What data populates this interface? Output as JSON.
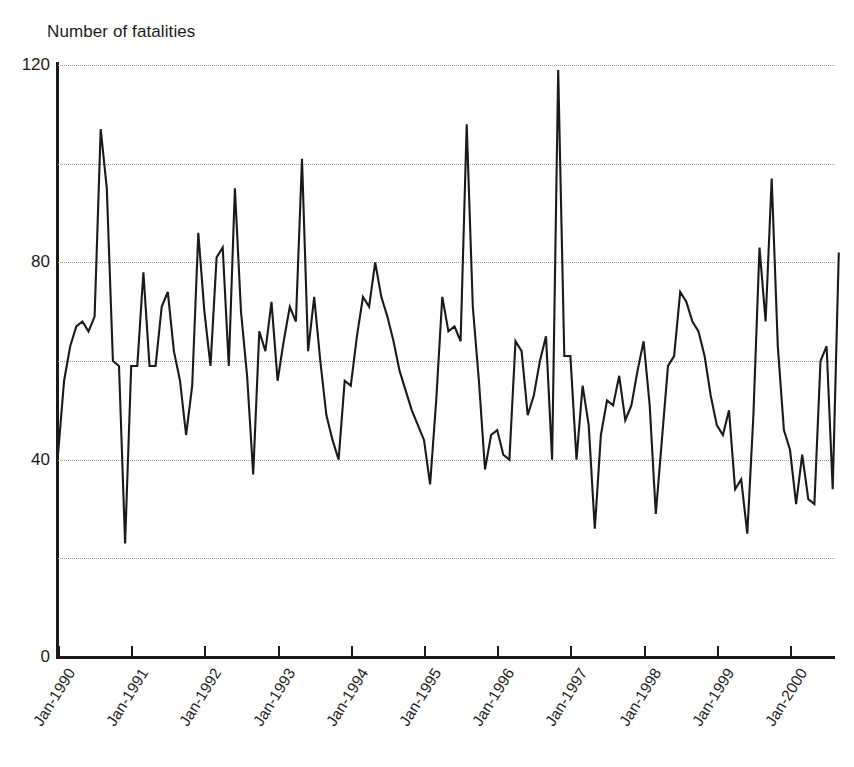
{
  "chart_data": {
    "type": "line",
    "title": "",
    "ylabel": "Number of fatalities",
    "xlabel": "",
    "ylim": [
      0,
      120
    ],
    "yticks": [
      0,
      40,
      80,
      120
    ],
    "gridlines": [
      20,
      40,
      60,
      80,
      100,
      120
    ],
    "grid": true,
    "legend": "none",
    "x_tick_labels": [
      "Jan-1990",
      "Jan-1991",
      "Jan-1992",
      "Jan-1993",
      "Jan-1994",
      "Jan-1995",
      "Jan-1996",
      "Jan-1997",
      "Jan-1998",
      "Jan-1999",
      "Jan-2000"
    ],
    "x_start": "Jan-1990",
    "x_end": "Sep-2000",
    "x_interval": "monthly",
    "series": [
      {
        "name": "Number of fatalities",
        "color": "#1a1a1a",
        "values": [
          41,
          56,
          63,
          67,
          68,
          66,
          69,
          107,
          95,
          60,
          59,
          23,
          59,
          59,
          78,
          59,
          59,
          71,
          74,
          62,
          56,
          45,
          55,
          86,
          70,
          59,
          81,
          83,
          59,
          95,
          70,
          57,
          37,
          66,
          62,
          72,
          56,
          64,
          71,
          68,
          101,
          62,
          73,
          60,
          49,
          44,
          40,
          56,
          55,
          65,
          73,
          71,
          80,
          73,
          69,
          64,
          58,
          54,
          50,
          47,
          44,
          35,
          52,
          73,
          66,
          67,
          64,
          108,
          71,
          56,
          38,
          45,
          46,
          41,
          40,
          64,
          62,
          49,
          53,
          60,
          65,
          40,
          119,
          61,
          61,
          40,
          55,
          47,
          26,
          45,
          52,
          51,
          57,
          48,
          51,
          58,
          64,
          51,
          29,
          44,
          59,
          61,
          74,
          72,
          68,
          66,
          61,
          53,
          47,
          45,
          50,
          34,
          36,
          25,
          49,
          83,
          68,
          97,
          63,
          46,
          42,
          31,
          41,
          32,
          31,
          60,
          63,
          34,
          82
        ]
      }
    ]
  }
}
